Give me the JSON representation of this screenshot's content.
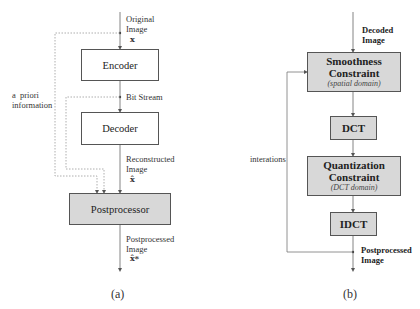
{
  "diagram_a": {
    "caption": "(a)",
    "input_label": [
      "Original",
      "Image"
    ],
    "input_symbol": "x",
    "encoder_label": "Encoder",
    "bitstream_label": "Bit Stream",
    "decoder_label": "Decoder",
    "reconstructed_label": [
      "Reconstructed",
      "Image"
    ],
    "reconstructed_symbol": "x̂",
    "postprocessor_label": "Postprocessor",
    "output_label": [
      "Postprocessed",
      "Image"
    ],
    "output_symbol": "x̂*",
    "side_label": [
      "a  priori",
      "information"
    ]
  },
  "diagram_b": {
    "caption": "(b)",
    "input_label": [
      "Decoded",
      "Image"
    ],
    "smoothness": {
      "title": [
        "Smoothness",
        "Constraint"
      ],
      "subtitle": "(spatial domain)"
    },
    "dct_label": "DCT",
    "quantization": {
      "title": [
        "Quantization",
        "Constraint"
      ],
      "subtitle": "(DCT domain)"
    },
    "idct_label": "IDCT",
    "loop_label": "interations",
    "output_label": [
      "Postprocessed",
      "Image"
    ]
  },
  "colors": {
    "box_fill_gray": "#d8d8d8",
    "line": "#666666",
    "dotted": "#999999"
  }
}
